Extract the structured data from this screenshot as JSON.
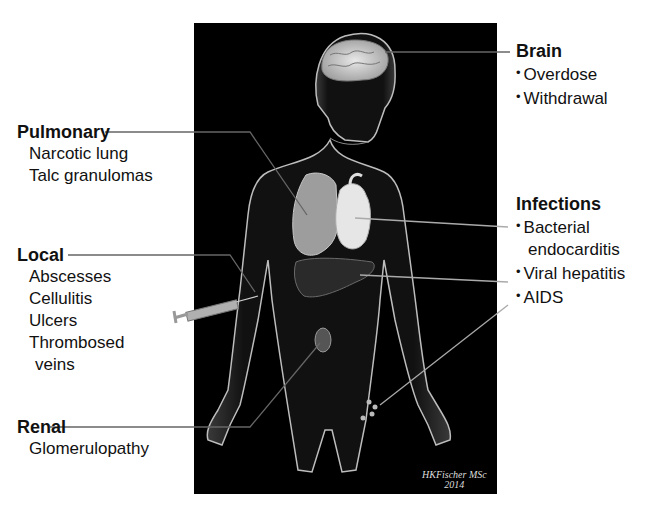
{
  "figure": {
    "background": "#000000",
    "signature": "HKFischer MSc",
    "signature_year": "2014"
  },
  "groups": {
    "brain": {
      "heading": "Brain",
      "items": [
        "Overdose",
        "Withdrawal"
      ],
      "bulleted": true
    },
    "pulmonary": {
      "heading": "Pulmonary",
      "items": [
        "Narcotic lung",
        "Talc granulomas"
      ],
      "bulleted": false
    },
    "infections": {
      "heading": "Infections",
      "items": [
        "Bacterial",
        "endocarditis",
        "Viral hepatitis",
        "AIDS"
      ],
      "bulleted": true
    },
    "local": {
      "heading": "Local",
      "items": [
        "Abscesses",
        "Cellulitis",
        "Ulcers",
        "Thrombosed",
        "veins"
      ],
      "bulleted": false
    },
    "renal": {
      "heading": "Renal",
      "items": [
        "Glomerulopathy"
      ],
      "bulleted": false
    }
  },
  "colors": {
    "text": "#111111",
    "leader_line": "#555555",
    "leader_line_inner": "#cfcfcf",
    "panel": "#000000"
  }
}
